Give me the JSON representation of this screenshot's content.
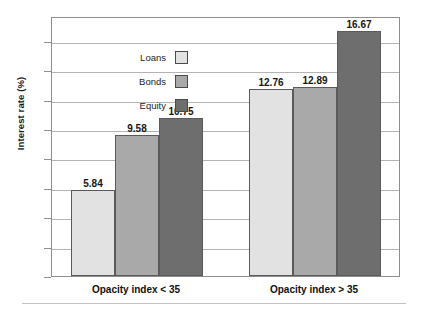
{
  "chart_data": {
    "type": "bar",
    "title": "",
    "subtitle": "",
    "xlabel": "",
    "ylabel": "Interest rate (%)",
    "categories": [
      "Opacity index < 35",
      "Opacity index > 35"
    ],
    "series": [
      {
        "name": "Loans",
        "values": [
          5.84,
          12.76
        ],
        "color": "#e2e2e2"
      },
      {
        "name": "Bonds",
        "values": [
          9.58,
          12.89
        ],
        "color": "#a9a9a9"
      },
      {
        "name": "Equity",
        "values": [
          10.75,
          16.67
        ],
        "color": "#6e6e6e"
      }
    ],
    "ylim": [
      0,
      17.7
    ],
    "yticks": [
      0,
      2,
      4,
      6,
      8,
      10,
      12,
      14,
      16
    ],
    "ytick_labels": [
      "0",
      "2",
      "4",
      "6",
      "8",
      "10",
      "12",
      "14",
      "16"
    ],
    "grid": true,
    "grid_axis": "y",
    "legend_position": "upper-left-inside",
    "data_labels": [
      "5.84",
      "9.58",
      "10.75",
      "12.76",
      "12.89",
      "16.67"
    ],
    "bar_border_color": "#5a5a5a",
    "gridline_color": "#b4b4b4",
    "frame_color": "#8d8d8d"
  }
}
